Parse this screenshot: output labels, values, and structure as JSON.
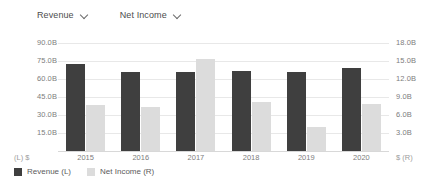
{
  "selectors": [
    {
      "label": "Revenue",
      "icon": "chevron-down-icon"
    },
    {
      "label": "Net Income",
      "icon": "chevron-down-icon"
    }
  ],
  "axis_units": {
    "left": "(L)  $",
    "right": "$  (R)"
  },
  "legend": [
    {
      "label": "Revenue (L)",
      "color": "#3f3f3f"
    },
    {
      "label": "Net Income (R)",
      "color": "#dcdcdc"
    }
  ],
  "chart_data": {
    "type": "bar",
    "title": "",
    "subtitle": "",
    "xlabel": "",
    "ylabel": "",
    "categories": [
      "2015",
      "2016",
      "2017",
      "2018",
      "2019",
      "2020"
    ],
    "series": [
      {
        "name": "Revenue (L)",
        "axis": "left",
        "color": "#3f3f3f",
        "values": [
          72.5,
          66.0,
          66.0,
          67.0,
          66.0,
          69.0
        ]
      },
      {
        "name": "Net Income (R)",
        "axis": "right",
        "color": "#dcdcdc",
        "values": [
          7.7,
          7.4,
          15.3,
          8.2,
          4.0,
          7.9
        ]
      }
    ],
    "left_axis": {
      "label": "(L)  $",
      "ticks": [
        "90.0B",
        "75.0B",
        "60.0B",
        "45.0B",
        "30.0B",
        "15.0B"
      ],
      "tick_values": [
        90,
        75,
        60,
        45,
        30,
        15
      ],
      "min": 0,
      "max": 90,
      "unit": "B"
    },
    "right_axis": {
      "label": "$  (R)",
      "ticks": [
        "18.0B",
        "15.0B",
        "12.0B",
        "9.0B",
        "6.0B",
        "3.0B"
      ],
      "tick_values": [
        18,
        15,
        12,
        9,
        6,
        3
      ],
      "min": 0,
      "max": 18,
      "unit": "B"
    },
    "grid": true,
    "legend_position": "bottom-left"
  }
}
